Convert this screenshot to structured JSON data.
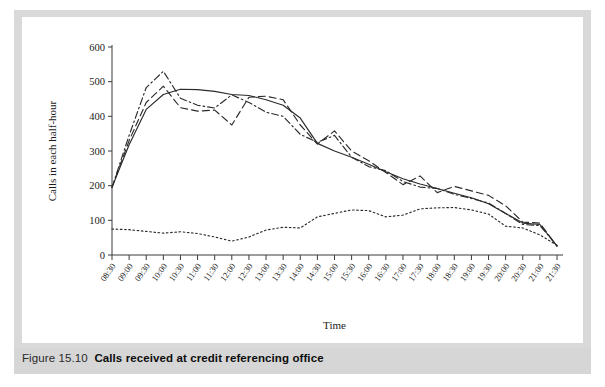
{
  "figure": {
    "caption_number": "Figure 15.10",
    "caption_title": "Calls received at credit referencing office"
  },
  "chart_data": {
    "type": "line",
    "title": "",
    "xlabel": "Time",
    "ylabel": "Calls in each half-hour",
    "ylim": [
      0,
      600
    ],
    "yticks": [
      0,
      100,
      200,
      300,
      400,
      500,
      600
    ],
    "grid": false,
    "legend_position": "bottom",
    "categories": [
      "08:30",
      "09:00",
      "09:30",
      "10:00",
      "10:30",
      "11:00",
      "11:30",
      "12:00",
      "12:30",
      "13:00",
      "13:30",
      "14:00",
      "14:30",
      "15:00",
      "15:30",
      "16:00",
      "16:30",
      "17:00",
      "17:30",
      "18:00",
      "18:30",
      "19:00",
      "19:30",
      "20:00",
      "20:30",
      "21:00",
      "21:30"
    ],
    "series": [
      {
        "name": "30 Aug",
        "style": "dashed",
        "values": [
          195,
          330,
          440,
          487,
          425,
          415,
          418,
          375,
          455,
          458,
          448,
          375,
          320,
          358,
          300,
          272,
          238,
          203,
          228,
          180,
          198,
          185,
          172,
          142,
          95,
          92,
          25
        ]
      },
      {
        "name": "6 Sept",
        "style": "dotted",
        "values": [
          75,
          73,
          68,
          63,
          67,
          62,
          52,
          40,
          52,
          72,
          80,
          78,
          110,
          120,
          130,
          128,
          110,
          115,
          133,
          136,
          137,
          130,
          118,
          83,
          78,
          58,
          28
        ]
      },
      {
        "name": "13 Sept",
        "style": "dashdot",
        "values": [
          195,
          345,
          483,
          530,
          452,
          432,
          424,
          462,
          440,
          412,
          400,
          348,
          325,
          345,
          282,
          255,
          243,
          212,
          196,
          192,
          175,
          163,
          150,
          120,
          88,
          85,
          27
        ]
      },
      {
        "name": "Moving average",
        "style": "solid",
        "values": [
          195,
          318,
          420,
          463,
          478,
          477,
          472,
          463,
          460,
          448,
          432,
          395,
          322,
          300,
          282,
          262,
          240,
          220,
          205,
          192,
          178,
          165,
          148,
          120,
          92,
          88,
          26
        ]
      }
    ]
  },
  "legend": {
    "items": [
      {
        "label": "30 Aug",
        "style": "dashed"
      },
      {
        "label": "6 Sept",
        "style": "dotted"
      },
      {
        "label": "13 Sept",
        "style": "dashdot"
      },
      {
        "label": "Moving average",
        "style": "solid"
      }
    ]
  }
}
